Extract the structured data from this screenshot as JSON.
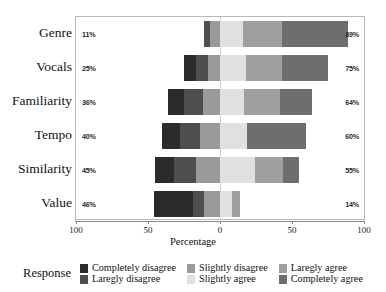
{
  "chart_data": {
    "type": "bar",
    "subtype": "diverging-stacked-likert",
    "title": "",
    "xlabel": "Percentage",
    "ylabel": "",
    "xlim": [
      -100,
      100
    ],
    "xticks": [
      100,
      50,
      0,
      50,
      100
    ],
    "xtick_positions": [
      -100,
      -50,
      0,
      50,
      100
    ],
    "grid": false,
    "legend_position": "bottom",
    "legend_title": "Response",
    "categories": [
      "Genre",
      "Vocals",
      "Familiarity",
      "Tempo",
      "Similarity",
      "Value"
    ],
    "series": [
      {
        "name": "Completely disagree",
        "color": "#2b2b2b",
        "values": [
          0,
          8,
          11,
          12,
          13,
          27
        ]
      },
      {
        "name": "Laregly disagree",
        "color": "#4e4e4e",
        "values": [
          4,
          9,
          13,
          14,
          15,
          8
        ]
      },
      {
        "name": "Slightly disagree",
        "color": "#9a9a9a",
        "values": [
          7,
          8,
          12,
          14,
          17,
          11
        ]
      },
      {
        "name": "Slightly agree",
        "color": "#e0e0e0",
        "values": [
          16,
          18,
          17,
          19,
          24,
          8
        ]
      },
      {
        "name": "Laregly agree",
        "color": "#9f9f9f",
        "values": [
          27,
          25,
          25,
          0,
          20,
          6
        ]
      },
      {
        "name": "Completely agree",
        "color": "#6e6e6e",
        "values": [
          46,
          32,
          22,
          41,
          11,
          0
        ]
      }
    ],
    "disagree_totals": [
      "11%",
      "25%",
      "36%",
      "40%",
      "45%",
      "46%"
    ],
    "agree_totals": [
      "89%",
      "75%",
      "64%",
      "60%",
      "55%",
      "14%"
    ],
    "rows": [
      {
        "label": "Genre",
        "left_pct": "11%",
        "right_pct": "89%",
        "neg": [
          {
            "s": 0,
            "w": 0
          },
          {
            "s": 1,
            "w": 4
          },
          {
            "s": 2,
            "w": 7
          }
        ],
        "pos": [
          {
            "s": 3,
            "w": 16
          },
          {
            "s": 4,
            "w": 27
          },
          {
            "s": 5,
            "w": 46
          }
        ]
      },
      {
        "label": "Vocals",
        "left_pct": "25%",
        "right_pct": "75%",
        "neg": [
          {
            "s": 0,
            "w": 8
          },
          {
            "s": 1,
            "w": 9
          },
          {
            "s": 2,
            "w": 8
          }
        ],
        "pos": [
          {
            "s": 3,
            "w": 18
          },
          {
            "s": 4,
            "w": 25
          },
          {
            "s": 5,
            "w": 32
          }
        ]
      },
      {
        "label": "Familiarity",
        "left_pct": "36%",
        "right_pct": "64%",
        "neg": [
          {
            "s": 0,
            "w": 11
          },
          {
            "s": 1,
            "w": 13
          },
          {
            "s": 2,
            "w": 12
          }
        ],
        "pos": [
          {
            "s": 3,
            "w": 17
          },
          {
            "s": 4,
            "w": 25
          },
          {
            "s": 5,
            "w": 22
          }
        ]
      },
      {
        "label": "Tempo",
        "left_pct": "40%",
        "right_pct": "60%",
        "neg": [
          {
            "s": 0,
            "w": 12
          },
          {
            "s": 1,
            "w": 14
          },
          {
            "s": 2,
            "w": 14
          }
        ],
        "pos": [
          {
            "s": 3,
            "w": 19
          },
          {
            "s": 4,
            "w": 0
          },
          {
            "s": 5,
            "w": 41
          }
        ]
      },
      {
        "label": "Similarity",
        "left_pct": "45%",
        "right_pct": "55%",
        "neg": [
          {
            "s": 0,
            "w": 13
          },
          {
            "s": 1,
            "w": 15
          },
          {
            "s": 2,
            "w": 17
          }
        ],
        "pos": [
          {
            "s": 3,
            "w": 24
          },
          {
            "s": 4,
            "w": 20
          },
          {
            "s": 5,
            "w": 11
          }
        ]
      },
      {
        "label": "Value",
        "left_pct": "46%",
        "right_pct": "14%",
        "neg": [
          {
            "s": 0,
            "w": 27
          },
          {
            "s": 1,
            "w": 8
          },
          {
            "s": 2,
            "w": 11
          }
        ],
        "pos": [
          {
            "s": 3,
            "w": 8
          },
          {
            "s": 4,
            "w": 6
          },
          {
            "s": 5,
            "w": 0
          }
        ]
      }
    ]
  },
  "legend": {
    "title": "Response",
    "columns": [
      {
        "items": [
          {
            "label": "Completely disagree",
            "color": "#2b2b2b"
          },
          {
            "label": "Laregly disagree",
            "color": "#4e4e4e"
          }
        ]
      },
      {
        "items": [
          {
            "label": "Slightly disagree",
            "color": "#9a9a9a"
          },
          {
            "label": "Slightly agree",
            "color": "#e0e0e0"
          }
        ]
      },
      {
        "items": [
          {
            "label": "Laregly agree",
            "color": "#9f9f9f"
          },
          {
            "label": "Completely agree",
            "color": "#6e6e6e"
          }
        ]
      }
    ]
  },
  "axis": {
    "xlabel": "Percentage",
    "ticks": [
      {
        "label": "100",
        "value": -100
      },
      {
        "label": "50",
        "value": -50
      },
      {
        "label": "0",
        "value": 0
      },
      {
        "label": "50",
        "value": 50
      },
      {
        "label": "100",
        "value": 100
      }
    ]
  }
}
